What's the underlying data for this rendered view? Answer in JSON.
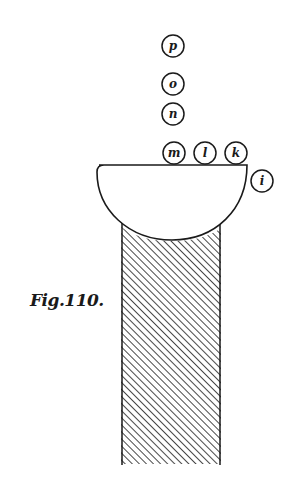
{
  "figure": {
    "caption": "Fig.110.",
    "ink_color": "#1a1a1a",
    "background": "#ffffff",
    "balls": [
      {
        "label": "p",
        "cx": 173,
        "cy": 46
      },
      {
        "label": "o",
        "cx": 173,
        "cy": 84
      },
      {
        "label": "n",
        "cx": 173,
        "cy": 114
      },
      {
        "label": "m",
        "cx": 174,
        "cy": 153
      },
      {
        "label": "l",
        "cx": 205,
        "cy": 153
      },
      {
        "label": "k",
        "cx": 236,
        "cy": 153
      },
      {
        "label": "i",
        "cx": 262,
        "cy": 181
      }
    ],
    "ball_radius": 11,
    "bowl": {
      "left": 97,
      "right": 247,
      "top": 165,
      "bottom": 241
    },
    "column": {
      "left": 121,
      "right": 221,
      "top": 222,
      "bottom": 464,
      "hatch_spacing": 5
    }
  }
}
